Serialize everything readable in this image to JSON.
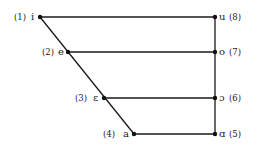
{
  "diagram": {
    "type": "vowel-quadrilateral",
    "line_color": "#1a1a1a",
    "front_vowels": [
      {
        "num": "(1)",
        "symbol": "i",
        "x": 40,
        "y": 17
      },
      {
        "num": "(2)",
        "symbol": "e",
        "x": 68,
        "y": 52
      },
      {
        "num": "(3)",
        "symbol": "ɛ",
        "x": 104,
        "y": 98
      },
      {
        "num": "(4)",
        "symbol": "a",
        "x": 134,
        "y": 134
      }
    ],
    "back_vowels": [
      {
        "num": "(8)",
        "symbol": "u",
        "x": 215,
        "y": 17
      },
      {
        "num": "(7)",
        "symbol": "o",
        "x": 215,
        "y": 52
      },
      {
        "num": "(6)",
        "symbol": "ɔ",
        "x": 215,
        "y": 98
      },
      {
        "num": "(5)",
        "symbol": "ɑ",
        "x": 215,
        "y": 134
      }
    ]
  }
}
